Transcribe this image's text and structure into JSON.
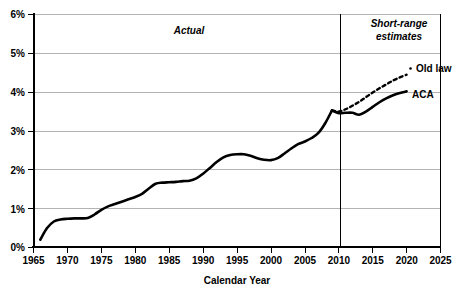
{
  "chart_data": {
    "type": "line",
    "title": "",
    "xlabel": "Calendar Year",
    "ylabel": "",
    "xlim": [
      1965,
      2025
    ],
    "ylim": [
      0,
      6
    ],
    "grid": true,
    "legend_position": "inline-right",
    "x_ticks": [
      1965,
      1970,
      1975,
      1980,
      1985,
      1990,
      1995,
      2000,
      2005,
      2010,
      2015,
      2020,
      2025
    ],
    "x_tick_labels": [
      "1965",
      "1970",
      "1975",
      "1980",
      "1985",
      "1990",
      "1995",
      "2000",
      "2005",
      "2010",
      "2015",
      "2020",
      "2025"
    ],
    "y_ticks": [
      0,
      1,
      2,
      3,
      4,
      5,
      6
    ],
    "y_tick_labels": [
      "0%",
      "1%",
      "2%",
      "3%",
      "4%",
      "5%",
      "6%"
    ],
    "annotations": [
      {
        "name": "actual-label",
        "text": "Actual",
        "x": 1990,
        "y": 5.45,
        "style": "italic"
      },
      {
        "name": "short-range-estimates-label",
        "text": "Short-range",
        "x": 2018,
        "y": 5.72,
        "style": "italic"
      },
      {
        "name": "short-range-estimates-label-line2",
        "text": "estimates",
        "x": 2018,
        "y": 5.35,
        "style": "italic"
      }
    ],
    "divider": {
      "name": "actual-estimate-divider",
      "x": 2009
    },
    "series": [
      {
        "name": "Actual",
        "label": "",
        "style": "solid",
        "x": [
          1966,
          1967,
          1968,
          1969,
          1970,
          1971,
          1972,
          1973,
          1974,
          1975,
          1976,
          1977,
          1978,
          1979,
          1980,
          1981,
          1982,
          1983,
          1984,
          1985,
          1986,
          1987,
          1988,
          1989,
          1990,
          1991,
          1992,
          1993,
          1994,
          1995,
          1996,
          1997,
          1998,
          1999,
          2000,
          2001,
          2002,
          2003,
          2004,
          2005,
          2006,
          2007,
          2008,
          2009
        ],
        "values": [
          0.2,
          0.5,
          0.67,
          0.72,
          0.74,
          0.75,
          0.75,
          0.76,
          0.85,
          0.97,
          1.06,
          1.12,
          1.18,
          1.24,
          1.3,
          1.38,
          1.52,
          1.64,
          1.67,
          1.68,
          1.69,
          1.71,
          1.72,
          1.78,
          1.9,
          2.05,
          2.2,
          2.32,
          2.38,
          2.4,
          2.4,
          2.36,
          2.3,
          2.26,
          2.25,
          2.3,
          2.42,
          2.55,
          2.66,
          2.73,
          2.82,
          2.95,
          3.2,
          3.53
        ]
      },
      {
        "name": "ACA",
        "label": "ACA",
        "style": "solid",
        "x": [
          2009,
          2010,
          2011,
          2012,
          2013,
          2014,
          2015,
          2016,
          2017,
          2018,
          2019,
          2020
        ],
        "values": [
          3.53,
          3.46,
          3.47,
          3.47,
          3.42,
          3.5,
          3.62,
          3.74,
          3.84,
          3.92,
          3.98,
          4.02
        ]
      },
      {
        "name": "Old law",
        "label": "Old law",
        "style": "dashed",
        "x": [
          2009,
          2010,
          2011,
          2012,
          2013,
          2014,
          2015,
          2016,
          2017,
          2018,
          2019,
          2020
        ],
        "values": [
          3.53,
          3.5,
          3.56,
          3.65,
          3.75,
          3.87,
          3.99,
          4.1,
          4.2,
          4.3,
          4.38,
          4.45
        ]
      }
    ]
  },
  "labels": {
    "old_law": "Old law",
    "aca": "ACA",
    "actual": "Actual",
    "short_range_1": "Short-range",
    "short_range_2": "estimates",
    "x_axis_title": "Calendar Year"
  }
}
